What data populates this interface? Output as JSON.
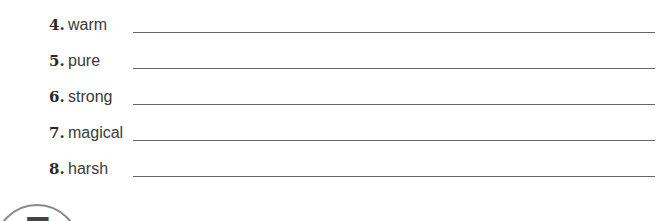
{
  "exercise": {
    "items": [
      {
        "number": "4.",
        "word": "warm"
      },
      {
        "number": "5.",
        "word": "pure"
      },
      {
        "number": "6.",
        "word": "strong"
      },
      {
        "number": "7.",
        "word": "magical"
      },
      {
        "number": "8.",
        "word": "harsh"
      }
    ]
  },
  "next_section": {
    "number": "7"
  }
}
